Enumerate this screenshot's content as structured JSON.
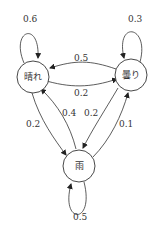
{
  "diagram": {
    "type": "markov-chain-state-transition",
    "nodes": [
      {
        "id": "sunny",
        "label": "晴れ"
      },
      {
        "id": "cloudy",
        "label": "曇り"
      },
      {
        "id": "rain",
        "label": "雨"
      }
    ],
    "edges": [
      {
        "from": "sunny",
        "to": "sunny",
        "prob": "0.6"
      },
      {
        "from": "cloudy",
        "to": "cloudy",
        "prob": "0.3"
      },
      {
        "from": "rain",
        "to": "rain",
        "prob": "0.5"
      },
      {
        "from": "cloudy",
        "to": "sunny",
        "prob": "0.5"
      },
      {
        "from": "sunny",
        "to": "cloudy",
        "prob": "0.2"
      },
      {
        "from": "sunny",
        "to": "rain",
        "prob": "0.2"
      },
      {
        "from": "rain",
        "to": "sunny",
        "prob": "0.4"
      },
      {
        "from": "cloudy",
        "to": "rain",
        "prob": "0.2"
      },
      {
        "from": "rain",
        "to": "cloudy",
        "prob": "0.1"
      }
    ],
    "colors": {
      "stroke": "#333333",
      "text": "#333333",
      "background": "#ffffff"
    }
  }
}
